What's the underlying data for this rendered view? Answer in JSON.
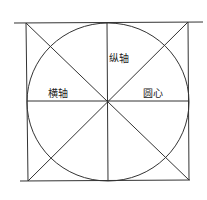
{
  "diagram": {
    "type": "circle-in-square construction",
    "labels": {
      "vertical_axis": "纵轴",
      "horizontal_axis": "横轴",
      "center": "圆心"
    },
    "colors": {
      "stroke": "#333333",
      "background": "#ffffff"
    }
  }
}
